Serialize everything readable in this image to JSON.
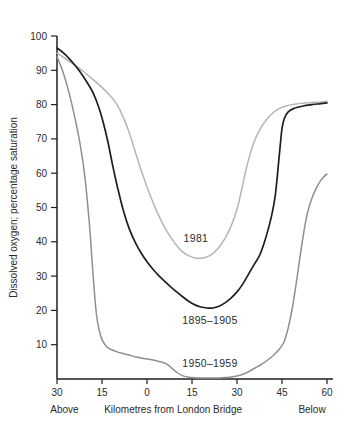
{
  "figure": {
    "background": "#ffffff",
    "axis_color": "#1f1f1f",
    "text_color": "#2b2b2b"
  },
  "chart_data": {
    "type": "line",
    "title": "",
    "xlabel": "Kilometres from London Bridge",
    "xlabel_left": "Above",
    "xlabel_right": "Below",
    "ylabel": "Dissolved oxygen; percentage saturation",
    "xlim": [
      -30,
      62
    ],
    "ylim": [
      0,
      100
    ],
    "grid": false,
    "legend_position": "inline-labels",
    "x_ticks": [
      {
        "value": -30,
        "label": "30"
      },
      {
        "value": -15,
        "label": "15"
      },
      {
        "value": 0,
        "label": "0"
      },
      {
        "value": 15,
        "label": "15"
      },
      {
        "value": 30,
        "label": "30"
      },
      {
        "value": 45,
        "label": "45"
      },
      {
        "value": 60,
        "label": "60"
      }
    ],
    "y_ticks": [
      {
        "value": 10,
        "label": "10"
      },
      {
        "value": 20,
        "label": "20"
      },
      {
        "value": 30,
        "label": "30"
      },
      {
        "value": 40,
        "label": "40"
      },
      {
        "value": 50,
        "label": "50"
      },
      {
        "value": 60,
        "label": "60"
      },
      {
        "value": 70,
        "label": "70"
      },
      {
        "value": 80,
        "label": "80"
      },
      {
        "value": 90,
        "label": "90"
      },
      {
        "value": 100,
        "label": "100"
      }
    ],
    "series": [
      {
        "name": "1981",
        "color": "#b5b5b5",
        "stroke_width": 1.5,
        "label_at": {
          "x": 16.3,
          "y": 41.1
        },
        "points": [
          [
            -30,
            95
          ],
          [
            -27,
            93.3
          ],
          [
            -24,
            91.5
          ],
          [
            -21,
            89.5
          ],
          [
            -18,
            87.3
          ],
          [
            -15,
            85
          ],
          [
            -12,
            82.3
          ],
          [
            -10,
            80
          ],
          [
            -8,
            76.5
          ],
          [
            -6,
            72
          ],
          [
            -4,
            66.5
          ],
          [
            -2,
            61
          ],
          [
            0,
            56
          ],
          [
            2,
            51.5
          ],
          [
            4,
            47.5
          ],
          [
            6,
            44
          ],
          [
            8,
            41.2
          ],
          [
            10,
            38.8
          ],
          [
            12,
            37
          ],
          [
            14,
            35.9
          ],
          [
            16,
            35.3
          ],
          [
            18,
            35.2
          ],
          [
            20,
            35.6
          ],
          [
            22,
            36.6
          ],
          [
            24,
            38.4
          ],
          [
            26,
            41
          ],
          [
            28,
            44.5
          ],
          [
            30,
            49.5
          ],
          [
            31.5,
            55
          ],
          [
            33,
            61
          ],
          [
            34.5,
            66
          ],
          [
            36,
            69.8
          ],
          [
            38,
            73.3
          ],
          [
            40,
            75.8
          ],
          [
            42,
            77.6
          ],
          [
            44,
            78.8
          ],
          [
            46,
            79.5
          ],
          [
            49,
            80.1
          ],
          [
            52,
            80.4
          ],
          [
            55,
            80.6
          ],
          [
            58,
            80.8
          ],
          [
            60,
            81
          ]
        ]
      },
      {
        "name": "1895–1905",
        "color": "#1e1e1e",
        "stroke_width": 1.7,
        "label_at": {
          "x": 21,
          "y": 17.2
        },
        "points": [
          [
            -30,
            96.5
          ],
          [
            -27.5,
            94.8
          ],
          [
            -25,
            92.5
          ],
          [
            -22.5,
            89.8
          ],
          [
            -20,
            86.5
          ],
          [
            -18,
            83.5
          ],
          [
            -16,
            79
          ],
          [
            -14.5,
            74.5
          ],
          [
            -13,
            69
          ],
          [
            -11.5,
            62.5
          ],
          [
            -10,
            56.5
          ],
          [
            -8,
            49.5
          ],
          [
            -6,
            44
          ],
          [
            -4,
            40
          ],
          [
            -2,
            36.8
          ],
          [
            0,
            34.2
          ],
          [
            2,
            32
          ],
          [
            4,
            30.1
          ],
          [
            6,
            28.4
          ],
          [
            8,
            26.8
          ],
          [
            10,
            25.3
          ],
          [
            12,
            23.9
          ],
          [
            14,
            22.6
          ],
          [
            16,
            21.6
          ],
          [
            18,
            21
          ],
          [
            20,
            20.7
          ],
          [
            22,
            20.7
          ],
          [
            24,
            21.2
          ],
          [
            26,
            22.2
          ],
          [
            28,
            23.6
          ],
          [
            30,
            25.4
          ],
          [
            32,
            27.8
          ],
          [
            34,
            30.8
          ],
          [
            36,
            33.8
          ],
          [
            37.5,
            36
          ],
          [
            39,
            39.5
          ],
          [
            40.5,
            44
          ],
          [
            41.5,
            47.5
          ],
          [
            42.5,
            52
          ],
          [
            43.2,
            57
          ],
          [
            43.8,
            62.5
          ],
          [
            44.4,
            68
          ],
          [
            45,
            73
          ],
          [
            45.8,
            76
          ],
          [
            47,
            77.8
          ],
          [
            49,
            78.9
          ],
          [
            52,
            79.6
          ],
          [
            55,
            80
          ],
          [
            58,
            80.3
          ],
          [
            60,
            80.5
          ]
        ]
      },
      {
        "name": "1950–1959",
        "color": "#8f8f8f",
        "stroke_width": 1.5,
        "label_at": {
          "x": 21,
          "y": 4.6
        },
        "points": [
          [
            -30,
            94
          ],
          [
            -28,
            89.5
          ],
          [
            -26,
            83.5
          ],
          [
            -24,
            76
          ],
          [
            -22.5,
            69.5
          ],
          [
            -21,
            61
          ],
          [
            -20,
            53
          ],
          [
            -19,
            43
          ],
          [
            -18.2,
            33
          ],
          [
            -17.5,
            25
          ],
          [
            -16.8,
            18.5
          ],
          [
            -16,
            14.5
          ],
          [
            -15,
            11.5
          ],
          [
            -13.5,
            9.5
          ],
          [
            -12,
            8.6
          ],
          [
            -10,
            7.9
          ],
          [
            -8,
            7.4
          ],
          [
            -6,
            7
          ],
          [
            -4,
            6.5
          ],
          [
            -2,
            6.1
          ],
          [
            0,
            5.8
          ],
          [
            2,
            5.5
          ],
          [
            4,
            5.1
          ],
          [
            6,
            4.6
          ],
          [
            8,
            3.4
          ],
          [
            10,
            1.9
          ],
          [
            12,
            0.9
          ],
          [
            14,
            0.5
          ],
          [
            16,
            0.35
          ],
          [
            18,
            0.3
          ],
          [
            20,
            0.3
          ],
          [
            22,
            0.3
          ],
          [
            24,
            0.3
          ],
          [
            26,
            0.4
          ],
          [
            28,
            0.6
          ],
          [
            30,
            0.9
          ],
          [
            32,
            1.4
          ],
          [
            34,
            2.2
          ],
          [
            36,
            3.2
          ],
          [
            38,
            4.2
          ],
          [
            40,
            5.4
          ],
          [
            42,
            6.8
          ],
          [
            44,
            8.6
          ],
          [
            45.5,
            10.5
          ],
          [
            46.5,
            13
          ],
          [
            47.5,
            16.5
          ],
          [
            48.5,
            21
          ],
          [
            49.5,
            26.5
          ],
          [
            50.5,
            32.5
          ],
          [
            51.5,
            38.5
          ],
          [
            52.5,
            44
          ],
          [
            53.5,
            48.5
          ],
          [
            55,
            52.8
          ],
          [
            56.5,
            55.8
          ],
          [
            58,
            58
          ],
          [
            59.3,
            59.3
          ],
          [
            60,
            59.7
          ]
        ]
      }
    ]
  }
}
